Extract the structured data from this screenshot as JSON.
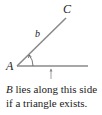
{
  "diagram": {
    "labels": {
      "vertex_a": "A",
      "vertex_c": "C",
      "side_b": "b"
    },
    "caption": {
      "line1_italic": "B",
      "line1_rest": " lies along this side",
      "line2": "if a triangle exists."
    },
    "colors": {
      "line": "#8a8a8a",
      "text": "#222222"
    }
  }
}
